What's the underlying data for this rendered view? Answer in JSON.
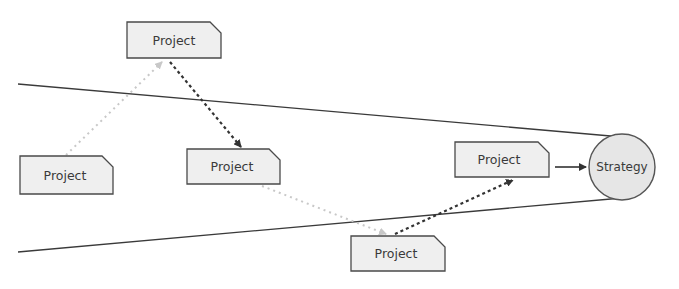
{
  "diagram": {
    "title": "",
    "colors": {
      "box_fill": "#efefef",
      "box_stroke": "#4a4a4a",
      "circle_fill": "#e6e6e6",
      "circle_stroke": "#555555",
      "funnel_line": "#3a3a3a",
      "aligned_arrow": "#333333",
      "faded_arrow": "#c8c8c8"
    },
    "nodes": [
      {
        "id": "project-top",
        "label": "Project",
        "shape": "clipped-rect"
      },
      {
        "id": "project-left",
        "label": "Project",
        "shape": "clipped-rect"
      },
      {
        "id": "project-middle",
        "label": "Project",
        "shape": "clipped-rect"
      },
      {
        "id": "project-bottom",
        "label": "Project",
        "shape": "clipped-rect"
      },
      {
        "id": "project-right",
        "label": "Project",
        "shape": "clipped-rect"
      },
      {
        "id": "strategy",
        "label": "Strategy",
        "shape": "circle"
      }
    ],
    "edges": [
      {
        "from": "project-left",
        "to": "project-top",
        "style": "dotted-light"
      },
      {
        "from": "project-top",
        "to": "project-middle",
        "style": "dashed-dark"
      },
      {
        "from": "project-middle",
        "to": "project-bottom",
        "style": "dotted-light"
      },
      {
        "from": "project-bottom",
        "to": "project-right",
        "style": "dashed-dark"
      },
      {
        "from": "project-right",
        "to": "strategy",
        "style": "solid"
      }
    ],
    "funnel": {
      "description": "two converging lines meeting at Strategy"
    }
  }
}
